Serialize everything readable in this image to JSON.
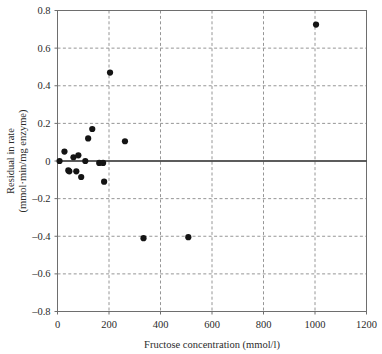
{
  "chart_data": {
    "type": "scatter",
    "title": "",
    "xlabel": "Fructose concentration (mmol/l)",
    "ylabel": "Residual in rate (mmol·min/mg enzyme)",
    "ylabel_line1": "Residual in rate",
    "ylabel_line2": "(mmol·min/mg enzyme)",
    "xlim": [
      0,
      1200
    ],
    "ylim": [
      -0.8,
      0.8
    ],
    "xticks": [
      0,
      200,
      400,
      600,
      800,
      1000,
      1200
    ],
    "xtick_labels": [
      "0",
      "200",
      "400",
      "600",
      "800",
      "1000",
      "1200"
    ],
    "yticks": [
      -0.8,
      -0.6,
      -0.4,
      -0.2,
      0,
      0.2,
      0.4,
      0.6,
      0.8
    ],
    "ytick_labels": [
      "–0.8",
      "–0.6",
      "–0.4",
      "–0.2",
      "0",
      "0.2",
      "0.4",
      "0.6",
      "0.8"
    ],
    "grid": true,
    "grid_style": "dashed",
    "zero_reference_line": 0,
    "legend": null,
    "marker": "filled-circle",
    "marker_color": "#141414",
    "series": [
      {
        "name": "residuals",
        "points": [
          {
            "x": 8,
            "y": 0.0
          },
          {
            "x": 27,
            "y": 0.05
          },
          {
            "x": 42,
            "y": -0.05
          },
          {
            "x": 46,
            "y": -0.055
          },
          {
            "x": 62,
            "y": 0.02
          },
          {
            "x": 73,
            "y": -0.055
          },
          {
            "x": 81,
            "y": 0.03
          },
          {
            "x": 92,
            "y": -0.085
          },
          {
            "x": 108,
            "y": 0.0
          },
          {
            "x": 119,
            "y": 0.12
          },
          {
            "x": 135,
            "y": 0.17
          },
          {
            "x": 162,
            "y": -0.01
          },
          {
            "x": 177,
            "y": -0.01
          },
          {
            "x": 181,
            "y": -0.11
          },
          {
            "x": 204,
            "y": 0.47
          },
          {
            "x": 262,
            "y": 0.105
          },
          {
            "x": 334,
            "y": -0.41
          },
          {
            "x": 508,
            "y": -0.405
          },
          {
            "x": 1004,
            "y": 0.725
          }
        ]
      }
    ]
  }
}
